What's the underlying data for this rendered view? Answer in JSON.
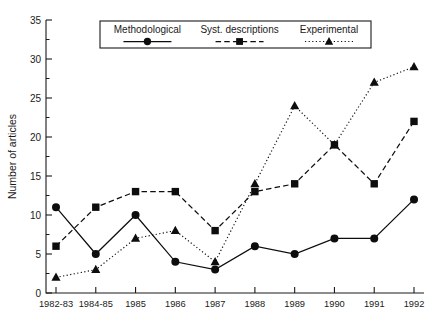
{
  "chart_data": {
    "type": "line",
    "title": "",
    "xlabel": "",
    "ylabel": "Number of articles",
    "categories": [
      "1982-83",
      "1984-85",
      "1985",
      "1986",
      "1987",
      "1988",
      "1989",
      "1990",
      "1991",
      "1992"
    ],
    "ylim": [
      0,
      35
    ],
    "ytick_labels": [
      "0",
      "5",
      "10",
      "15",
      "20",
      "25",
      "30",
      "35"
    ],
    "ytick_values": [
      0,
      5,
      10,
      15,
      20,
      25,
      30,
      35
    ],
    "yminor_values": [
      2.5,
      7.5,
      12.5,
      17.5,
      22.5,
      27.5,
      32.5
    ],
    "grid": false,
    "legend_position": "top-center",
    "series": [
      {
        "name": "Methodological",
        "marker": "circle",
        "linestyle": "solid",
        "color": "#0d0d0d",
        "values": [
          11,
          5,
          10,
          4,
          3,
          6,
          5,
          7,
          7,
          12
        ]
      },
      {
        "name": "Syst. descriptions",
        "marker": "square",
        "linestyle": "dashed",
        "color": "#0d0d0d",
        "values": [
          6,
          11,
          13,
          13,
          8,
          13,
          14,
          19,
          14,
          22
        ]
      },
      {
        "name": "Experimental",
        "marker": "triangle",
        "linestyle": "dotted",
        "color": "#0d0d0d",
        "values": [
          2,
          3,
          7,
          8,
          4,
          14,
          24,
          19,
          27,
          29
        ]
      }
    ]
  },
  "legend": {
    "items": [
      {
        "label": "Methodological"
      },
      {
        "label": "Syst. descriptions"
      },
      {
        "label": "Experimental"
      }
    ]
  },
  "axes": {
    "y_title": "Number of articles"
  }
}
